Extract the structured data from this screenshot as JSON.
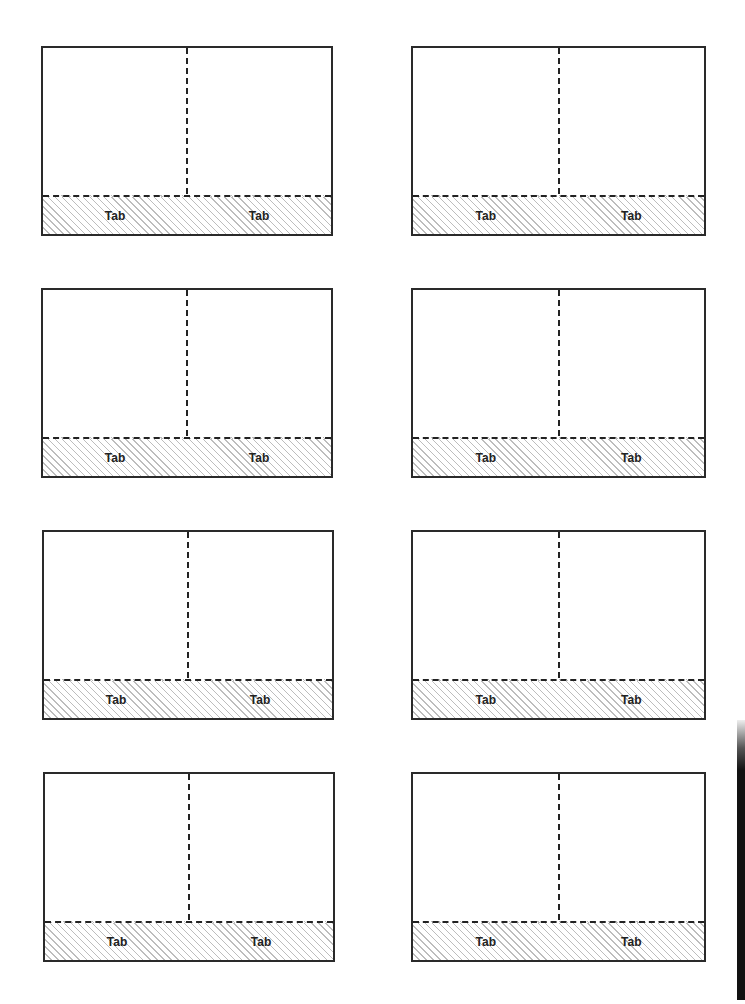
{
  "sheet": {
    "title": "",
    "cards": [
      {
        "row": 1,
        "col": 1,
        "tabs": [
          {
            "label": "Tab"
          },
          {
            "label": "Tab"
          }
        ]
      },
      {
        "row": 1,
        "col": 2,
        "tabs": [
          {
            "label": "Tab"
          },
          {
            "label": "Tab"
          }
        ]
      },
      {
        "row": 2,
        "col": 1,
        "tabs": [
          {
            "label": "Tab"
          },
          {
            "label": "Tab"
          }
        ]
      },
      {
        "row": 2,
        "col": 2,
        "tabs": [
          {
            "label": "Tab"
          },
          {
            "label": "Tab"
          }
        ]
      },
      {
        "row": 3,
        "col": 1,
        "tabs": [
          {
            "label": "Tab"
          },
          {
            "label": "Tab"
          }
        ]
      },
      {
        "row": 3,
        "col": 2,
        "tabs": [
          {
            "label": "Tab"
          },
          {
            "label": "Tab"
          }
        ]
      },
      {
        "row": 4,
        "col": 1,
        "tabs": [
          {
            "label": "Tab"
          },
          {
            "label": "Tab"
          }
        ]
      },
      {
        "row": 4,
        "col": 2,
        "tabs": [
          {
            "label": "Tab"
          },
          {
            "label": "Tab"
          }
        ]
      }
    ],
    "colors": {
      "border": "#2a2a2a",
      "hatch": "#bdbdbd",
      "background": "#ffffff"
    }
  }
}
